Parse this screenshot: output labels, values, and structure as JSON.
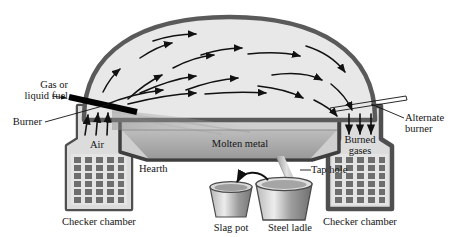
{
  "diagram": {
    "labels": {
      "gas_or_liquid_fuel_line1": "Gas or",
      "gas_or_liquid_fuel_line2": "liquid fuel",
      "burner": "Burner",
      "air": "Air",
      "hearth": "Hearth",
      "molten_metal": "Molten metal",
      "tap_hole": "Tap hole",
      "slag_pot": "Slag pot",
      "steel_ladle": "Steel ladle",
      "checker_chamber_left": "Checker chamber",
      "checker_chamber_right": "Checker chamber",
      "burned_line1": "Burned",
      "burned_line2": "gases",
      "alternate_burner_line1": "Alternate",
      "alternate_burner_line2": "burner"
    },
    "checker_grid": {
      "columns": 5,
      "rows": 6
    },
    "air_arrows": 3,
    "burned_gas_arrows": 3,
    "colors": {
      "outline": "#5a5a5a",
      "dome_fill": "#e6e6e6",
      "molten_metal": "#a9a9a9",
      "hearth_wall": "#c9c9c9",
      "checker_brick": "#6e6e6e",
      "chamber_fill": "#d8d8d8",
      "burner_active": "#000000",
      "burner_alternate": "#ffffff",
      "ink": "#141414"
    }
  }
}
